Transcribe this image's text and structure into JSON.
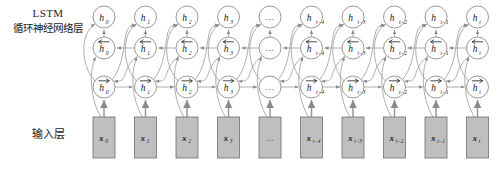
{
  "figure": {
    "type": "bidirectional-lstm-architecture",
    "background": "#ffffff",
    "node_fill": "#ffffff",
    "node_stroke": "#8d8d8d",
    "input_box_fill": "#bfbfbf",
    "input_box_stroke": "#6e6e6e",
    "edge_color": "#9a9a9a"
  },
  "labels": {
    "lstm_en": "LSTM",
    "lstm_cn": "循环神经网络层",
    "input_cn": "输入层"
  },
  "columns": [
    {
      "index": 0,
      "output": "h",
      "sub": "0",
      "backward": "h",
      "forward": "h",
      "input": "x",
      "ellipsis": false
    },
    {
      "index": 1,
      "output": "h",
      "sub": "1",
      "backward": "h",
      "forward": "h",
      "input": "x",
      "ellipsis": false
    },
    {
      "index": 2,
      "output": "h",
      "sub": "2",
      "backward": "h",
      "forward": "h",
      "input": "x",
      "ellipsis": false
    },
    {
      "index": 3,
      "output": "h",
      "sub": "3",
      "backward": "h",
      "forward": "h",
      "input": "x",
      "ellipsis": false
    },
    {
      "index": 4,
      "output": "…",
      "sub": "",
      "backward": "…",
      "forward": "…",
      "input": "…",
      "ellipsis": true
    },
    {
      "index": 5,
      "output": "h",
      "sub": "t−4",
      "backward": "h",
      "forward": "h",
      "input": "x",
      "ellipsis": false
    },
    {
      "index": 6,
      "output": "h",
      "sub": "t−3",
      "backward": "h",
      "forward": "h",
      "input": "x",
      "ellipsis": false
    },
    {
      "index": 7,
      "output": "h",
      "sub": "t−2",
      "backward": "h",
      "forward": "h",
      "input": "x",
      "ellipsis": false
    },
    {
      "index": 8,
      "output": "h",
      "sub": "t−1",
      "backward": "h",
      "forward": "h",
      "input": "x",
      "ellipsis": false
    },
    {
      "index": 9,
      "output": "h",
      "sub": "t",
      "backward": "h",
      "forward": "h",
      "input": "x",
      "ellipsis": false
    }
  ],
  "rows": {
    "output_row_name": "output-hidden-state",
    "backward_row_name": "backward-hidden-state",
    "forward_row_name": "forward-hidden-state",
    "input_row_name": "input-sequence"
  },
  "geometry": {
    "first_col_x": 104,
    "col_spacing": 41.5,
    "n_cols": 10,
    "y_output": 17,
    "y_backward": 48,
    "y_forward": 87,
    "box_top": 117,
    "box_height": 41,
    "box_width": 22,
    "node_r": 11
  }
}
